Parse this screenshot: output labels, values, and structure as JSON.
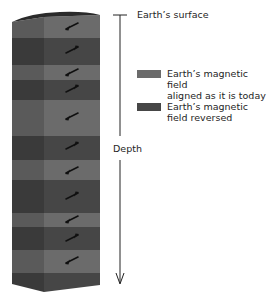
{
  "labels": {
    "surface": "Earth’s surface",
    "depth": "Depth"
  },
  "legend": {
    "items": [
      {
        "label": "Earth’s magnetic field\naligned as it is today",
        "color": "#6b6b6b",
        "polarity": "normal"
      },
      {
        "label": "Earth’s magnetic\nfield reversed",
        "color": "#464646",
        "polarity": "reversed"
      }
    ]
  },
  "column": {
    "colors": {
      "normal_front": "#6b6b6b",
      "normal_side": "#5a5a5a",
      "reversed_front": "#464646",
      "reversed_side": "#3a3a3a",
      "top": "#2a2a2a",
      "arrow": "#111111"
    },
    "bands": [
      {
        "polarity": "normal",
        "y0": 15,
        "y1": 38
      },
      {
        "polarity": "reversed",
        "y0": 38,
        "y1": 65
      },
      {
        "polarity": "normal",
        "y0": 65,
        "y1": 80
      },
      {
        "polarity": "reversed",
        "y0": 80,
        "y1": 100
      },
      {
        "polarity": "normal",
        "y0": 100,
        "y1": 136
      },
      {
        "polarity": "reversed",
        "y0": 136,
        "y1": 160
      },
      {
        "polarity": "normal",
        "y0": 160,
        "y1": 180
      },
      {
        "polarity": "reversed",
        "y0": 180,
        "y1": 213
      },
      {
        "polarity": "normal",
        "y0": 213,
        "y1": 227
      },
      {
        "polarity": "reversed",
        "y0": 227,
        "y1": 250
      },
      {
        "polarity": "normal",
        "y0": 250,
        "y1": 273
      },
      {
        "polarity": "reversed",
        "y0": 273,
        "y1": 292
      }
    ],
    "arrows": [
      {
        "y": 26,
        "direction": "lower-left"
      },
      {
        "y": 50,
        "direction": "upper-right"
      },
      {
        "y": 72,
        "direction": "lower-left"
      },
      {
        "y": 89,
        "direction": "upper-right"
      },
      {
        "y": 116,
        "direction": "lower-left"
      },
      {
        "y": 146,
        "direction": "upper-right"
      },
      {
        "y": 170,
        "direction": "lower-left"
      },
      {
        "y": 196,
        "direction": "upper-right"
      },
      {
        "y": 219,
        "direction": "lower-left"
      },
      {
        "y": 238,
        "direction": "upper-right"
      },
      {
        "y": 260,
        "direction": "lower-left"
      }
    ]
  }
}
